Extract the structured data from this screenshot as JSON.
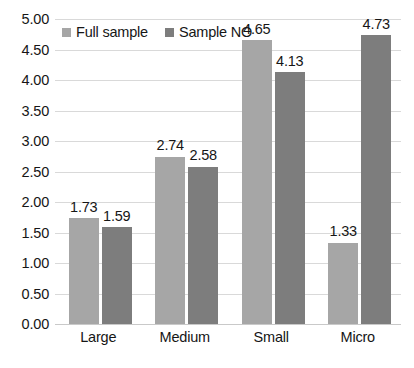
{
  "chart_data": {
    "type": "bar",
    "title": "",
    "subtitle": "",
    "xlabel": "",
    "ylabel": "",
    "categories": [
      "Large",
      "Medium",
      "Small",
      "Micro"
    ],
    "series": [
      {
        "name": "Full sample",
        "color": "#a6a6a6",
        "values": [
          1.73,
          2.74,
          4.65,
          1.33
        ]
      },
      {
        "name": "Sample NO",
        "color": "#7d7d7d",
        "values": [
          1.59,
          2.58,
          4.13,
          4.73
        ]
      }
    ],
    "data_labels": [
      [
        "1.73",
        "1.59"
      ],
      [
        "2.74",
        "2.58"
      ],
      [
        "4.65",
        "4.13"
      ],
      [
        "1.33",
        "4.73"
      ]
    ],
    "ylim": [
      0,
      5
    ],
    "ytick_step": 0.5,
    "ytick_labels": [
      "5.00",
      "4.50",
      "4.00",
      "3.50",
      "3.00",
      "2.50",
      "2.00",
      "1.50",
      "1.00",
      "0.50",
      "0.00"
    ],
    "ytick_values": [
      5.0,
      4.5,
      4.0,
      3.5,
      3.0,
      2.5,
      2.0,
      1.5,
      1.0,
      0.5,
      0.0
    ],
    "grid": true,
    "grid_axis": "y",
    "legend_position": "top-left",
    "background_color": "#ffffff",
    "grid_color": "#d9d9d9",
    "text_color": "#161616"
  },
  "legend": {
    "items": [
      {
        "label": "Full sample",
        "color": "#a6a6a6"
      },
      {
        "label": "Sample NO",
        "color": "#7d7d7d"
      }
    ]
  }
}
